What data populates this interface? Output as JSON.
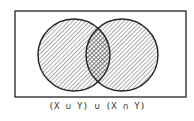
{
  "diagram": {
    "type": "venn",
    "universe": {
      "x": 15,
      "y": 11,
      "width": 171,
      "height": 86
    },
    "sets": [
      {
        "name": "X",
        "cx": 74,
        "cy": 55,
        "r": 36,
        "shaded": true
      },
      {
        "name": "Y",
        "cx": 122,
        "cy": 55,
        "r": 36,
        "shaded": true
      }
    ],
    "intersection": {
      "shading": "cross-hatched"
    },
    "stroke_color": "#222222",
    "hatch_color": "#444444"
  },
  "caption": "(X ∪ Y)  ∪  (X ∩ Y)"
}
